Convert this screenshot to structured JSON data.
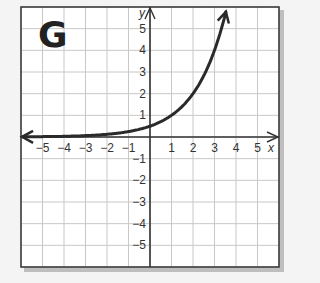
{
  "panel_label": "G",
  "colors": {
    "background": "#f4f4f4",
    "plot_bg": "#ffffff",
    "grid": "#c8c8c8",
    "axis": "#333333",
    "curve": "#2a2a2a",
    "frame": "#333333",
    "shadow": "#9a9a9a"
  },
  "chart_data": {
    "type": "line",
    "title": "G",
    "xlabel": "x",
    "ylabel": "y",
    "xlim": [
      -6,
      6
    ],
    "ylim": [
      -6,
      6
    ],
    "grid": true,
    "legend": null,
    "x_ticks": [
      -5,
      -4,
      -3,
      -2,
      -1,
      1,
      2,
      3,
      4,
      5
    ],
    "y_ticks": [
      5,
      4,
      3,
      2,
      1,
      -1,
      -2,
      -3,
      -4,
      -5
    ],
    "x_tick_labels": [
      "−5",
      "−4",
      "−3",
      "−2",
      "−1",
      "1",
      "2",
      "3",
      "4",
      "5"
    ],
    "y_tick_labels": [
      "5",
      "4",
      "3",
      "2",
      "1",
      "−1",
      "−2",
      "−3",
      "−4",
      "−5"
    ],
    "series": [
      {
        "name": "y = 0.5·2^x",
        "function": "0.5*2^x",
        "x": [
          -6,
          -5,
          -4,
          -3,
          -2,
          -1,
          0,
          1,
          2,
          3,
          3.5
        ],
        "y": [
          0.008,
          0.016,
          0.031,
          0.063,
          0.125,
          0.25,
          0.5,
          1,
          2,
          4,
          5.66
        ],
        "arrows": "both ends"
      }
    ],
    "asymptote": "y = 0"
  }
}
